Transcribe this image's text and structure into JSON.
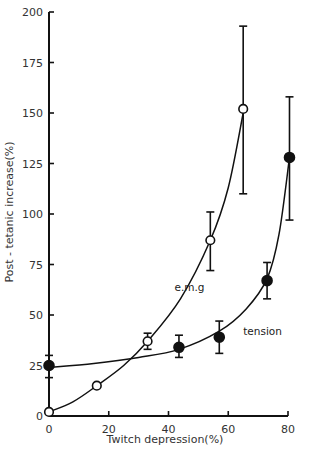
{
  "chart_data": {
    "type": "scatter",
    "title": "",
    "xlabel": "Twitch depression(%)",
    "ylabel": "Post - tetanic increase(%)",
    "xlim": [
      0,
      80
    ],
    "ylim": [
      0,
      200
    ],
    "x_ticks": [
      0,
      20,
      40,
      60,
      80
    ],
    "x_tick_labels": [
      "0",
      "20",
      "40",
      "60",
      "80"
    ],
    "y_ticks": [
      0,
      25,
      50,
      75,
      100,
      125,
      150,
      175,
      200
    ],
    "y_tick_labels": [
      "0",
      "25",
      "50",
      "75",
      "100",
      "125",
      "150",
      "175",
      "200"
    ],
    "grid": false,
    "legend": null,
    "series": [
      {
        "name": "e.m.g",
        "marker": "open-circle",
        "x": [
          0,
          16,
          33,
          54,
          65
        ],
        "y": [
          2,
          15,
          37,
          87,
          152
        ],
        "err_low": [
          2,
          15,
          33,
          72,
          110
        ],
        "err_high": [
          2,
          15,
          41,
          101,
          193
        ],
        "fit_curve": "exponential"
      },
      {
        "name": "tension",
        "marker": "filled-circle",
        "x": [
          0,
          43.5,
          57,
          73,
          80.5
        ],
        "y": [
          25,
          34,
          39,
          67,
          128
        ],
        "err_low": [
          19,
          29,
          31,
          58,
          97
        ],
        "err_high": [
          30,
          40,
          47,
          76,
          158
        ],
        "fit_curve": "exponential"
      }
    ],
    "annotations": [
      {
        "text": "e.m.g",
        "x": 42,
        "y": 62
      },
      {
        "text": "tension",
        "x": 65,
        "y": 40
      }
    ]
  }
}
